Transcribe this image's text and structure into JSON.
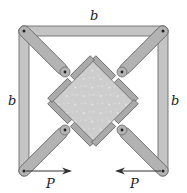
{
  "diagram": {
    "type": "mechanism",
    "labels": {
      "top": "b",
      "left": "b",
      "right": "b",
      "force_left": "P",
      "force_right": "P"
    },
    "colors": {
      "bar_fill": "#b9b9b9",
      "bar_stroke": "#6e6e6e",
      "block_fill": "#cfcfcf",
      "pin": "#222222",
      "arrow": "#333333"
    },
    "forces": [
      {
        "label": "P",
        "at": "bottom-left corner",
        "direction": "right"
      },
      {
        "label": "P",
        "at": "bottom-right corner",
        "direction": "left"
      }
    ]
  }
}
